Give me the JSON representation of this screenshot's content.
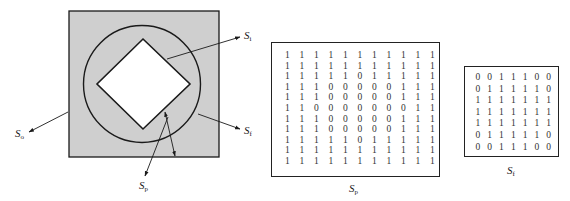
{
  "figure": {
    "left_diagram": {
      "labels": {
        "s_i": {
          "base": "S",
          "sub": "i"
        },
        "s_o": {
          "base": "S",
          "sub": "o"
        },
        "s_f": {
          "base": "S",
          "sub": "f"
        },
        "s_p": {
          "base": "S",
          "sub": "p"
        }
      },
      "colors": {
        "fill": "#cfcfcf",
        "stroke": "#1a1a1a",
        "hole": "#ffffff"
      }
    },
    "matrix_sp": {
      "label": {
        "base": "S",
        "sub": "p"
      },
      "rows": [
        [
          1,
          1,
          1,
          1,
          1,
          1,
          1,
          1,
          1,
          1,
          1
        ],
        [
          1,
          1,
          1,
          1,
          1,
          1,
          1,
          1,
          1,
          1,
          1
        ],
        [
          1,
          1,
          1,
          1,
          1,
          0,
          1,
          1,
          1,
          1,
          1
        ],
        [
          1,
          1,
          1,
          0,
          0,
          0,
          0,
          0,
          1,
          1,
          1
        ],
        [
          1,
          1,
          1,
          0,
          0,
          0,
          0,
          0,
          1,
          1,
          1
        ],
        [
          1,
          1,
          0,
          0,
          0,
          0,
          0,
          0,
          0,
          1,
          1
        ],
        [
          1,
          1,
          1,
          0,
          0,
          0,
          0,
          0,
          1,
          1,
          1
        ],
        [
          1,
          1,
          1,
          0,
          0,
          0,
          0,
          0,
          1,
          1,
          1
        ],
        [
          1,
          1,
          1,
          1,
          1,
          0,
          1,
          1,
          1,
          1,
          1
        ],
        [
          1,
          1,
          1,
          1,
          1,
          1,
          1,
          1,
          1,
          1,
          1
        ],
        [
          1,
          1,
          1,
          1,
          1,
          1,
          1,
          1,
          1,
          1,
          1
        ]
      ]
    },
    "matrix_sf": {
      "label": {
        "base": "S",
        "sub": "f"
      },
      "rows": [
        [
          0,
          0,
          1,
          1,
          1,
          0,
          0
        ],
        [
          0,
          1,
          1,
          1,
          1,
          1,
          0
        ],
        [
          1,
          1,
          1,
          1,
          1,
          1,
          1
        ],
        [
          1,
          1,
          1,
          1,
          1,
          1,
          1
        ],
        [
          1,
          1,
          1,
          1,
          1,
          1,
          1
        ],
        [
          0,
          1,
          1,
          1,
          1,
          1,
          0
        ],
        [
          0,
          0,
          1,
          1,
          1,
          0,
          0
        ]
      ]
    }
  }
}
